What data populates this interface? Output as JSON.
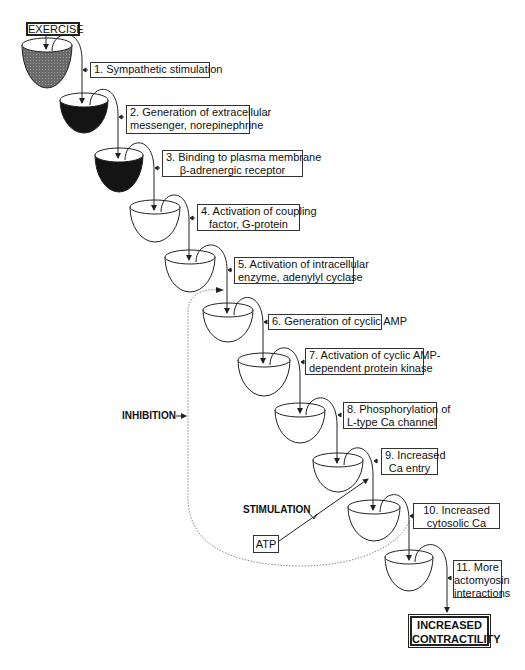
{
  "diagram": {
    "start_label": "EXERCISE",
    "end_label_line1": "INCREASED",
    "end_label_line2": "CONTRACTILITY",
    "inhibition_label": "INHIBITION",
    "stimulation_label": "STIMULATION",
    "atp_label": "ATP",
    "steps": [
      {
        "line1": "1. Sympathetic stimulation",
        "line2": "",
        "bowl_fill": "gray"
      },
      {
        "line1": "2. Generation of extracellular",
        "line2": "messenger, norepinephrine",
        "bowl_fill": "black"
      },
      {
        "line1": "3. Binding to plasma membrane",
        "line2": "β-adrenergic receptor",
        "bowl_fill": "black"
      },
      {
        "line1": "4. Activation of coupling",
        "line2": "factor, G-protein",
        "bowl_fill": "white"
      },
      {
        "line1": "5. Activation of intracellular",
        "line2": "enzyme, adenylyl cyclase",
        "bowl_fill": "white"
      },
      {
        "line1": "6. Generation of cyclic AMP",
        "line2": "",
        "bowl_fill": "white"
      },
      {
        "line1": "7. Activation of cyclic AMP-",
        "line2": "dependent protein kinase",
        "bowl_fill": "white"
      },
      {
        "line1": "8. Phosphorylation of",
        "line2": "L-type Ca channel",
        "bowl_fill": "white"
      },
      {
        "line1": "9. Increased",
        "line2": "Ca entry",
        "bowl_fill": "white"
      },
      {
        "line1": "10. Increased",
        "line2": "cytosolic Ca",
        "bowl_fill": "white"
      },
      {
        "line1": "11. More",
        "line2": "actomyosin",
        "line3": "interactions",
        "bowl_fill": "white"
      }
    ],
    "colors": {
      "line": "#222222",
      "gray_fill": "#6a6a6a",
      "black_fill": "#141414",
      "dotted": "#888888"
    }
  }
}
